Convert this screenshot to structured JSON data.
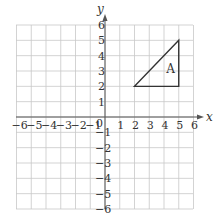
{
  "diagram": {
    "type": "coordinate-grid",
    "x_axis_label": "x",
    "y_axis_label": "y",
    "x_range": [
      -6,
      6
    ],
    "y_range": [
      -6,
      6
    ],
    "origin_label": "0",
    "x_ticks": [
      "-6",
      "-5",
      "-4",
      "-3",
      "-2",
      "-1",
      "1",
      "2",
      "3",
      "4",
      "5",
      "6"
    ],
    "y_ticks": [
      "6",
      "5",
      "4",
      "3",
      "2",
      "1",
      "-1",
      "-2",
      "-3",
      "-4",
      "-5",
      "-6"
    ],
    "shape": {
      "label": "A",
      "kind": "triangle",
      "vertices": [
        [
          2,
          2
        ],
        [
          5,
          2
        ],
        [
          5,
          5
        ]
      ]
    },
    "colors": {
      "grid": "#c8c8c8",
      "axis": "#555555",
      "shape": "#333333"
    }
  }
}
